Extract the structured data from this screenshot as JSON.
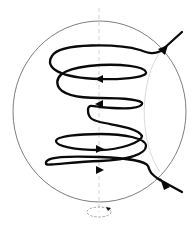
{
  "diagram": {
    "elements": {
      "sphere": {
        "shape": "circle-outline",
        "color": "#6e6e6e"
      },
      "axis": {
        "shape": "dashed-vertical-line",
        "color": "#c8c8c8"
      },
      "trajectory": {
        "shape": "helix",
        "loops": 5,
        "color": "#0a0a0a",
        "direction_arrows_top": "leftward",
        "direction_arrows_bottom": "rightward"
      },
      "incoming_arrow": {
        "position": "top-right",
        "direction": "into-sphere"
      },
      "outgoing_arrow": {
        "position": "bottom-right",
        "direction": "out-of-sphere"
      },
      "rotation_indicator": {
        "shape": "dashed-ellipse-with-arrow",
        "position": "bottom-axis"
      }
    },
    "text_labels": []
  }
}
